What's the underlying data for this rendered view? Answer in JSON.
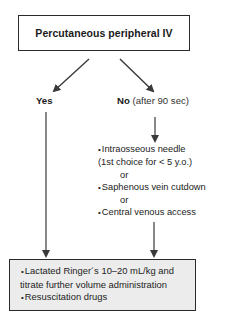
{
  "diagram": {
    "start_box": {
      "title": "Percutaneous peripheral IV"
    },
    "branches": {
      "yes": {
        "label": "Yes"
      },
      "no": {
        "label": "No",
        "condition": "(after 90 sec)"
      }
    },
    "alternatives": {
      "items": [
        {
          "bullet": "•",
          "text": "Intraosseous needle"
        },
        {
          "text": "(1st choice for < 5 y.o.)"
        },
        {
          "connector": "or"
        },
        {
          "bullet": "•",
          "text": "Saphenous vein cutdown"
        },
        {
          "connector": "or"
        },
        {
          "bullet": "•",
          "text": "Central venous access"
        }
      ]
    },
    "result_box": {
      "items": [
        {
          "bullet": "•",
          "text": "Lactated Ringer´s 10–20 mL/kg and"
        },
        {
          "text": "titrate further volume administration"
        },
        {
          "bullet": "•",
          "text": "Resuscitation drugs"
        }
      ],
      "fill_color": "#ececec"
    },
    "colors": {
      "arrow": "#3a3a3a",
      "border": "#2a2a2a"
    }
  }
}
